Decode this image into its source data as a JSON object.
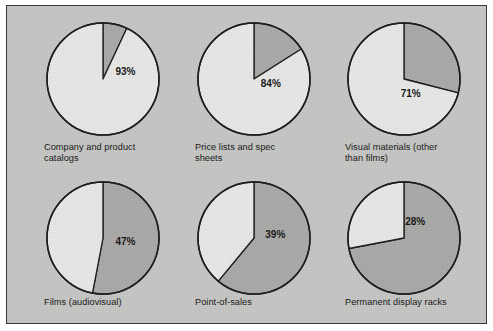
{
  "figure": {
    "panel_background": "#c6c6c4",
    "frame_color": "#3a3a38",
    "page_background": "#ffffff"
  },
  "chart_data": {
    "type": "pie",
    "title": "",
    "subtitle": "",
    "xlabel": "",
    "ylabel": "",
    "legend_position": "none",
    "grid": false,
    "slice_colors": {
      "highlight": "#e8e8e6",
      "remainder": "#a9a9a7",
      "outline": "#1a1a1a"
    },
    "value_unit": "%",
    "start_angle_deg": 0,
    "highlight_direction": "counterclockwise",
    "charts": [
      {
        "id": "company-and-product-catalogs",
        "label": "Company and product\ncatalogs",
        "value": 93,
        "value_label": "93%",
        "remainder": 7,
        "slices": [
          {
            "name": "highlight",
            "value": 93
          },
          {
            "name": "remainder",
            "value": 7
          }
        ]
      },
      {
        "id": "price-lists-and-spec-sheets",
        "label": "Price lists and spec\nsheets",
        "value": 84,
        "value_label": "84%",
        "remainder": 16,
        "slices": [
          {
            "name": "highlight",
            "value": 84
          },
          {
            "name": "remainder",
            "value": 16
          }
        ]
      },
      {
        "id": "visual-materials-other-than-films",
        "label": "Visual materials (other\nthan films)",
        "value": 71,
        "value_label": "71%",
        "remainder": 29,
        "slices": [
          {
            "name": "highlight",
            "value": 71
          },
          {
            "name": "remainder",
            "value": 29
          }
        ]
      },
      {
        "id": "films-audiovisual",
        "label": "Films (audiovisual)",
        "value": 47,
        "value_label": "47%",
        "remainder": 53,
        "slices": [
          {
            "name": "highlight",
            "value": 47
          },
          {
            "name": "remainder",
            "value": 53
          }
        ]
      },
      {
        "id": "point-of-sales",
        "label": "Point-of-sales",
        "value": 39,
        "value_label": "39%",
        "remainder": 61,
        "slices": [
          {
            "name": "highlight",
            "value": 39
          },
          {
            "name": "remainder",
            "value": 61
          }
        ]
      },
      {
        "id": "permanent-display-racks",
        "label": "Permanent display racks",
        "value": 28,
        "value_label": "28%",
        "remainder": 72,
        "slices": [
          {
            "name": "highlight",
            "value": 28
          },
          {
            "name": "remainder",
            "value": 72
          }
        ]
      }
    ]
  },
  "layout": {
    "cells": [
      {
        "x": 37,
        "y": 14,
        "label_x": 37,
        "label_y": 136,
        "pct_x": 0.4,
        "pct_y": -0.12
      },
      {
        "x": 188,
        "y": 14,
        "label_x": 188,
        "label_y": 136,
        "pct_x": 0.3,
        "pct_y": 0.1
      },
      {
        "x": 338,
        "y": 14,
        "label_x": 338,
        "label_y": 136,
        "pct_x": 0.12,
        "pct_y": 0.28
      },
      {
        "x": 37,
        "y": 173,
        "label_x": 37,
        "label_y": 291,
        "pct_x": 0.4,
        "pct_y": 0.08
      },
      {
        "x": 188,
        "y": 173,
        "label_x": 188,
        "label_y": 291,
        "pct_x": 0.38,
        "pct_y": -0.05
      },
      {
        "x": 338,
        "y": 173,
        "label_x": 338,
        "label_y": 291,
        "pct_x": 0.2,
        "pct_y": -0.28
      }
    ],
    "pie_size": 118,
    "pie_radius": 56
  }
}
